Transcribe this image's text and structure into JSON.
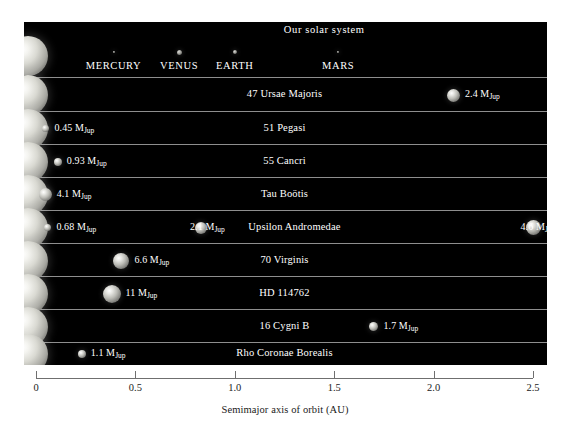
{
  "figure": {
    "xlabel": "Semimajor axis of orbit (AU)",
    "axis_min": 0,
    "axis_max": 2.5,
    "tick_labels": [
      "0",
      "0.5",
      "1.0",
      "1.5",
      "2.0",
      "2.5"
    ],
    "tick_values": [
      0,
      0.5,
      1.0,
      1.5,
      2.0,
      2.5
    ],
    "mass_unit_symbol": "M",
    "mass_unit_sub": "Jup"
  },
  "chart_data": {
    "type": "scatter",
    "title": "",
    "xlabel": "Semimajor axis of orbit (AU)",
    "ylabel": "",
    "xlim": [
      0,
      2.5
    ],
    "grid": false,
    "legend": "none",
    "rows": [
      {
        "system": "Our solar system",
        "system_label_x": 1.45,
        "star_radius_au": 0.0,
        "planets": [
          {
            "name": "MERCURY",
            "a": 0.39,
            "mass_label": "",
            "size": 2
          },
          {
            "name": "VENUS",
            "a": 0.72,
            "mass_label": "",
            "size": 5
          },
          {
            "name": "EARTH",
            "a": 1.0,
            "mass_label": "",
            "size": 4
          },
          {
            "name": "MARS",
            "a": 1.52,
            "mass_label": "",
            "size": 2
          }
        ]
      },
      {
        "system": "47 Ursae Majoris",
        "system_label_x": 1.25,
        "planets": [
          {
            "a": 2.1,
            "mass": 2.4,
            "mass_label": "2.4",
            "size": 13,
            "label_side": "right"
          }
        ]
      },
      {
        "system": "51 Pegasi",
        "system_label_x": 1.25,
        "planets": [
          {
            "a": 0.05,
            "mass": 0.45,
            "mass_label": "0.45",
            "size": 7,
            "label_side": "right"
          }
        ]
      },
      {
        "system": "55 Cancri",
        "system_label_x": 1.25,
        "planets": [
          {
            "a": 0.11,
            "mass": 0.93,
            "mass_label": "0.93",
            "size": 8,
            "label_side": "right"
          }
        ]
      },
      {
        "system": "Tau Boötis",
        "system_label_x": 1.25,
        "planets": [
          {
            "a": 0.046,
            "mass": 4.1,
            "mass_label": "4.1",
            "size": 13,
            "label_side": "right"
          }
        ]
      },
      {
        "system": "Upsilon Andromedae",
        "system_label_x": 1.3,
        "planets": [
          {
            "a": 0.06,
            "mass": 0.68,
            "mass_label": "0.68",
            "size": 7,
            "label_side": "right"
          },
          {
            "a": 0.83,
            "mass": 2.1,
            "mass_label": "2.1",
            "size": 12,
            "label_side": "left"
          },
          {
            "a": 2.5,
            "mass": 4.6,
            "mass_label": "4.6",
            "size": 15,
            "label_side": "left"
          }
        ]
      },
      {
        "system": "70 Virginis",
        "system_label_x": 1.25,
        "planets": [
          {
            "a": 0.43,
            "mass": 6.6,
            "mass_label": "6.6",
            "size": 16,
            "label_side": "right"
          }
        ]
      },
      {
        "system": "HD 114762",
        "system_label_x": 1.25,
        "planets": [
          {
            "a": 0.38,
            "mass": 11,
            "mass_label": "11",
            "size": 18,
            "label_side": "right"
          }
        ]
      },
      {
        "system": "16 Cygni B",
        "system_label_x": 1.25,
        "planets": [
          {
            "a": 1.7,
            "mass": 1.7,
            "mass_label": "1.7",
            "size": 9,
            "label_side": "right"
          }
        ]
      },
      {
        "system": "Rho Coronae Borealis",
        "system_label_x": 1.25,
        "planets": [
          {
            "a": 0.23,
            "mass": 1.1,
            "mass_label": "1.1",
            "size": 8,
            "label_side": "right"
          }
        ]
      }
    ]
  }
}
